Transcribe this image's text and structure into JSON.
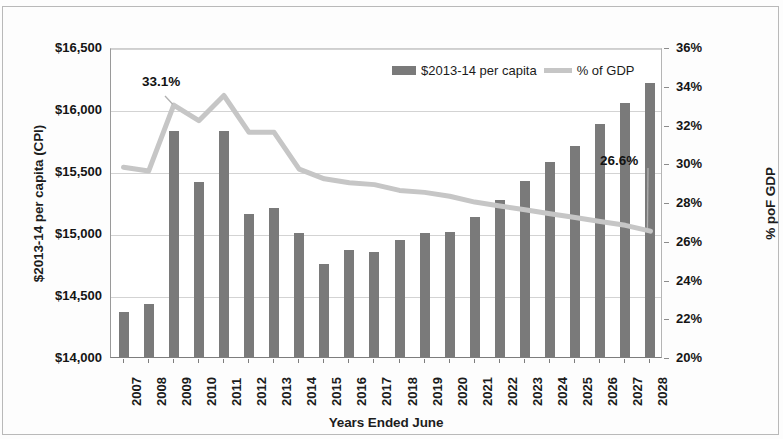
{
  "chart_data": {
    "type": "bar",
    "title": "",
    "xlabel": "Years Ended June",
    "ylabel": "$2013-14 per capita (CPI)",
    "y2label": "% poF GDP",
    "categories": [
      "2007",
      "2008",
      "2009",
      "2010",
      "2011",
      "2012",
      "2013",
      "2014",
      "2015",
      "2016",
      "2017",
      "2018",
      "2019",
      "2020",
      "2021",
      "2022",
      "2023",
      "2024",
      "2025",
      "2026",
      "2027",
      "2028"
    ],
    "ylim": [
      14000,
      16500
    ],
    "yticks": [
      14000,
      14500,
      15000,
      15500,
      16000,
      16500
    ],
    "ytick_labels": [
      "$14,000",
      "$14,500",
      "$15,000",
      "$15,500",
      "$16,000",
      "$16,500"
    ],
    "y2lim": [
      20,
      36
    ],
    "y2ticks": [
      20,
      22,
      24,
      26,
      28,
      30,
      32,
      34,
      36
    ],
    "y2tick_labels": [
      "20%",
      "22%",
      "24%",
      "26%",
      "28%",
      "30%",
      "32%",
      "34%",
      "36%"
    ],
    "grid": true,
    "legend_position": "top-center",
    "series": [
      {
        "name": "$2013-14 per capita",
        "type": "bar",
        "axis": "left",
        "color": "#7a7a7a",
        "values": [
          14360,
          14430,
          15820,
          15410,
          15820,
          15150,
          15200,
          15000,
          14750,
          14860,
          14850,
          14940,
          15000,
          15010,
          15130,
          15270,
          15420,
          15570,
          15700,
          15880,
          16050,
          16210
        ]
      },
      {
        "name": "% of GDP",
        "type": "line",
        "axis": "right",
        "color": "#c6c6c6",
        "values": [
          29.9,
          29.7,
          33.1,
          32.3,
          33.6,
          31.7,
          31.7,
          29.8,
          29.3,
          29.1,
          29.0,
          28.7,
          28.6,
          28.4,
          28.1,
          27.9,
          27.7,
          27.5,
          27.3,
          27.1,
          26.9,
          26.6
        ]
      }
    ],
    "annotations": [
      {
        "label": "33.1%",
        "series": "% of GDP",
        "category": "2009",
        "value": 33.1
      },
      {
        "label": "26.6%",
        "series": "% of GDP",
        "category": "2028",
        "value": 26.6
      }
    ]
  },
  "legend": {
    "entries": [
      {
        "label": "$2013-14 per capita",
        "marker": "bar-swatch-icon"
      },
      {
        "label": "% of GDP",
        "marker": "line-swatch-icon"
      }
    ]
  },
  "annotations": {
    "peak": "33.1%",
    "end": "26.6%"
  },
  "axes": {
    "left_title": "$2013-14 per capita (CPI)",
    "right_title": "% poF GDP",
    "bottom_title": "Years Ended June"
  }
}
